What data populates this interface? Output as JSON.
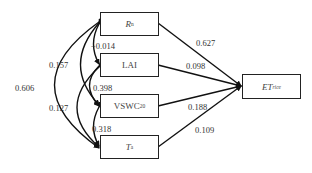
{
  "nodes": {
    "rn": {
      "main": "R",
      "sub": "n"
    },
    "lai": {
      "main": "LAI",
      "sub": ""
    },
    "vswc": {
      "main": "VSWC",
      "sub": "20"
    },
    "ta": {
      "main": "T",
      "sub": "a"
    },
    "et": {
      "main": "ET",
      "sub": "rice"
    }
  },
  "path_coefficients": {
    "rn_et": "0.627",
    "lai_et": "0.098",
    "vswc_et": "0.188",
    "ta_et": "0.109"
  },
  "correlations": {
    "rn_lai": "−0.014",
    "rn_vswc": "0.157",
    "rn_ta": "0.606",
    "lai_vswc": "0.398",
    "lai_ta": "0.127",
    "vswc_ta": "0.318"
  }
}
